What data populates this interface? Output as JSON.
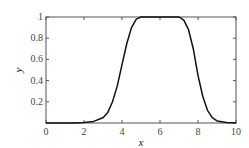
{
  "chart_data": {
    "type": "line",
    "title": "",
    "xlabel": "x",
    "ylabel": "y",
    "xlim": [
      0,
      10
    ],
    "ylim": [
      0,
      1
    ],
    "xticks": [
      "0",
      "2",
      "4",
      "6",
      "8",
      "10"
    ],
    "yticks": [
      "0.2",
      "0.4",
      "0.6",
      "0.8",
      "1"
    ],
    "grid": false,
    "series": [
      {
        "name": "y",
        "x": [
          0,
          1,
          1.5,
          2,
          2.5,
          3,
          3.25,
          3.5,
          3.75,
          4,
          4.25,
          4.5,
          4.75,
          5,
          5.5,
          6,
          6.5,
          7,
          7.25,
          7.5,
          7.75,
          8,
          8.25,
          8.5,
          8.75,
          9,
          9.5,
          10
        ],
        "values": [
          0,
          0,
          0,
          0.005,
          0.015,
          0.05,
          0.1,
          0.2,
          0.35,
          0.55,
          0.75,
          0.9,
          0.98,
          1,
          1,
          1,
          1,
          1,
          0.97,
          0.88,
          0.7,
          0.45,
          0.25,
          0.12,
          0.05,
          0.02,
          0.005,
          0
        ]
      }
    ]
  }
}
